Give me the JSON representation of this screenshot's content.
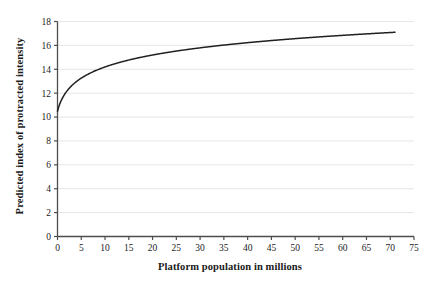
{
  "chart_data": {
    "type": "line",
    "title": "",
    "xlabel": "Platform population in millions",
    "ylabel": "Predicted index of protracted intensity",
    "xlim": [
      0,
      75
    ],
    "ylim": [
      0,
      18
    ],
    "xticks": [
      "0",
      "5",
      "10",
      "15",
      "20",
      "25",
      "30",
      "35",
      "40",
      "45",
      "50",
      "55",
      "60",
      "65",
      "70",
      "75"
    ],
    "yticks": [
      "0",
      "2",
      "4",
      "6",
      "8",
      "10",
      "12",
      "14",
      "16",
      "18"
    ],
    "grid": "horizontal",
    "legend": "none",
    "series": [
      {
        "name": "Predicted index of protracted intensity",
        "color": "#231f20",
        "x": [
          0,
          0.25,
          0.5,
          0.75,
          1,
          1.5,
          2,
          2.5,
          3,
          4,
          5,
          6,
          7,
          8,
          9,
          10,
          12,
          14,
          16,
          18,
          20,
          22.5,
          25,
          27.5,
          30,
          32.5,
          35,
          37.5,
          40,
          45,
          50,
          55,
          60,
          65,
          71
        ],
        "y": [
          6.32,
          8.04,
          9.11,
          9.89,
          10.49,
          11.4,
          12.07,
          12.6,
          13.04,
          13.74,
          14.28,
          14.72,
          15.09,
          15.41,
          15.69,
          15.94,
          16.36,
          16.71,
          17.02,
          17.28,
          17.52,
          17.79,
          18.02,
          18.24,
          18.43,
          18.61,
          18.78,
          18.93,
          19.07,
          19.33,
          19.55,
          19.75,
          19.93,
          20.09,
          20.26
        ]
      }
    ],
    "curve_model": {
      "form": "y = a + b*ln(x + c)",
      "a": 10.49,
      "b": 1.545,
      "c": 1.0,
      "x_start": 0,
      "x_end": 71,
      "y_start": 6.3,
      "y_end": 17.05
    },
    "axis_color": "#4d4d4d",
    "grid_color": "#e6e6e6",
    "line_color": "#231f20",
    "background": "#ffffff"
  }
}
